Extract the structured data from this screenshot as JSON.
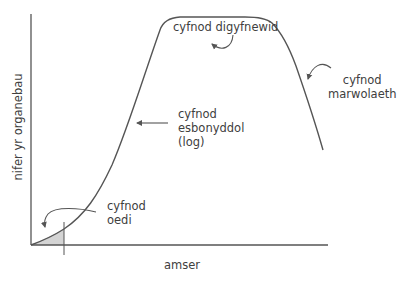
{
  "diagram": {
    "x_axis_label": "amser",
    "y_axis_label": "nifer yr organebau",
    "phases": [
      {
        "id": "lag",
        "line1": "cyfnod",
        "line2": "oedi"
      },
      {
        "id": "log",
        "line1": "cyfnod",
        "line2": "esbonyddol",
        "line3": "(log)"
      },
      {
        "id": "stationary",
        "line1": "cyfnod digyfnewid"
      },
      {
        "id": "death",
        "line1": "cyfnod",
        "line2": "marwolaeth"
      }
    ],
    "colors": {
      "line": "#555555",
      "shade": "#d4d4d4",
      "text": "#404040"
    }
  }
}
